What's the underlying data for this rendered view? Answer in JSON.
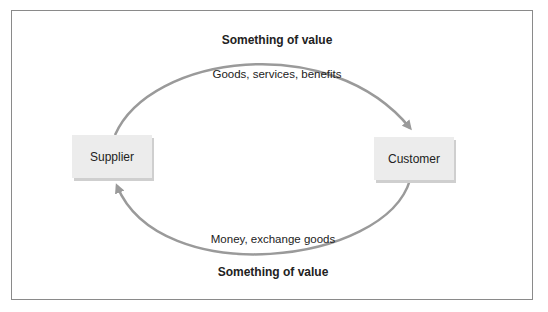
{
  "diagram": {
    "nodes": [
      {
        "id": "supplier",
        "label": "Supplier"
      },
      {
        "id": "customer",
        "label": "Customer"
      }
    ],
    "top_flow": {
      "heading": "Something of value",
      "label": "Goods, services, benefits",
      "from": "supplier",
      "to": "customer"
    },
    "bottom_flow": {
      "heading": "Something of value",
      "label": "Money, exchange goods",
      "from": "customer",
      "to": "supplier"
    },
    "colors": {
      "arrow": "#9a9a9a",
      "box_fill": "#ececec",
      "frame": "#8a8a8a"
    }
  }
}
